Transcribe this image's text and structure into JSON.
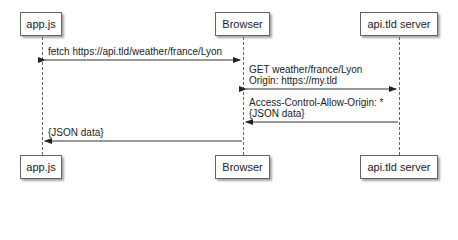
{
  "actors": {
    "app": "app.js",
    "browser": "Browser",
    "server": "api.tld server"
  },
  "messages": {
    "m1": "fetch https://api.tld/weather/france/Lyon",
    "m2_line1": "GET weather/france/Lyon",
    "m2_line2": "Origin: https://my.tld",
    "m3_line1": "Access-Control-Allow-Origin: *",
    "m3_line2": "{JSON data}",
    "m4": "{JSON data}"
  }
}
